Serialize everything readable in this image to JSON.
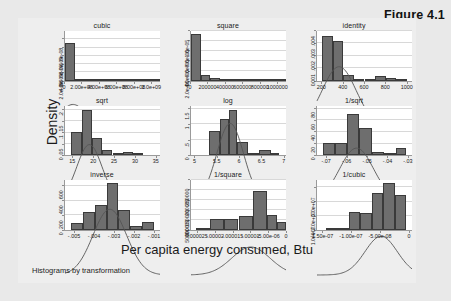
{
  "figure": {
    "caption": "Figure 4.1",
    "ylabel": "Density",
    "xlabel": "Per capita energy consumed, Btu",
    "note": "Histograms by transformation"
  },
  "style": {
    "bar_fill": "#6e6e6e",
    "bar_edge": "#3a3a3a",
    "plot_bg": "#ffffff",
    "page_bg": "#e9e9e9",
    "graph_bg": "#eeeeee",
    "grid": "#d8d8d8",
    "curve": "#555555"
  },
  "chart_data": {
    "type": "bar",
    "title": "Histograms by transformation",
    "xlabel": "Per capita energy consumed, Btu",
    "ylabel": "Density",
    "layout": {
      "rows": 3,
      "cols": 3,
      "grid": true,
      "legend": "none",
      "overlay": "normal density curve"
    },
    "panels": [
      {
        "title": "cubic",
        "row": 1,
        "col": 1,
        "xlim": [
          0,
          1100000000.0
        ],
        "ylim": [
          0,
          1.2e-08
        ],
        "xticks": [
          0,
          200000000.0,
          400000000.0,
          600000000.0,
          800000000.0,
          1000000000.0
        ],
        "xticklabels": [
          "0",
          "2.00e+08",
          "4.00e+08",
          "6.00e+08",
          "8.00e+08",
          "1.0e+09"
        ],
        "yticks": [
          0,
          2e-09,
          4e-09,
          6e-09,
          8e-09,
          1e-08
        ],
        "yticklabels": [
          "0",
          "2.0e-09",
          "4.0e-09",
          "6.0e-09",
          "8.0e-09",
          "1.0e-08"
        ],
        "bin_edges": [
          0,
          110000000.0,
          220000000.0,
          330000000.0,
          440000000.0,
          550000000.0,
          660000000.0,
          770000000.0,
          880000000.0,
          990000000.0,
          1100000000.0
        ],
        "values": [
          9.1e-09,
          4e-10,
          1e-10,
          2.5e-10,
          1e-10,
          0,
          0,
          0,
          1e-10,
          1e-10
        ]
      },
      {
        "title": "square",
        "row": 1,
        "col": 2,
        "xlim": [
          0,
          1100000
        ],
        "ylim": [
          0,
          1e-05
        ],
        "xticks": [
          0,
          200000,
          400000,
          600000,
          800000,
          1000000
        ],
        "xticklabels": [
          "0",
          "200000",
          "400000",
          "600000",
          "800000",
          "1000000"
        ],
        "yticks": [
          0,
          2e-06,
          4e-06,
          6e-06,
          8e-06,
          1e-05
        ],
        "yticklabels": [
          "0",
          "2.0e-06",
          "4.0e-06",
          "6.0e-06",
          "8.0e-06",
          "1.0e-05"
        ],
        "bin_edges": [
          0,
          110000,
          220000,
          330000,
          440000,
          550000,
          660000,
          770000,
          880000,
          990000,
          1100000
        ],
        "values": [
          9.3e-06,
          1.1e-06,
          5e-07,
          1e-07,
          1e-07,
          4e-07,
          3e-07,
          1e-07,
          1e-07,
          1e-07
        ]
      },
      {
        "title": "identity",
        "row": 1,
        "col": 3,
        "xlim": [
          150,
          1050
        ],
        "ylim": [
          0,
          0.004
        ],
        "xticks": [
          200,
          400,
          600,
          800,
          1000
        ],
        "xticklabels": [
          "200",
          "400",
          "600",
          "800",
          "1000"
        ],
        "yticks": [
          0,
          0.001,
          0.002,
          0.003,
          0.004
        ],
        "yticklabels": [
          "0",
          ".001",
          ".002",
          ".003",
          ".004"
        ],
        "bin_edges": [
          200,
          300,
          400,
          500,
          600,
          700,
          800,
          900,
          1000
        ],
        "values": [
          0.0036,
          0.0032,
          0.00045,
          0.00015,
          0.0001,
          0.0004,
          0.00025,
          8e-05
        ]
      },
      {
        "title": "sqrt",
        "row": 2,
        "col": 1,
        "xlim": [
          13,
          36
        ],
        "ylim": [
          0,
          0.22
        ],
        "xticks": [
          15,
          20,
          25,
          30,
          35
        ],
        "xticklabels": [
          "15",
          "20",
          "25",
          "30",
          "35"
        ],
        "yticks": [
          0,
          0.05,
          0.1,
          0.15,
          0.2
        ],
        "yticklabels": [
          "0",
          ".05",
          ".1",
          ".15",
          ".2"
        ],
        "bin_edges": [
          14.5,
          17,
          19.5,
          22,
          24.5,
          27,
          29.5,
          32
        ],
        "values": [
          0.102,
          0.2,
          0.075,
          0.022,
          0.004,
          0.013,
          0.006
        ]
      },
      {
        "title": "log",
        "row": 2,
        "col": 2,
        "xlim": [
          4.9,
          7.05
        ],
        "ylim": [
          0,
          1.6
        ],
        "xticks": [
          5,
          5.5,
          6,
          6.5,
          7
        ],
        "xticklabels": [
          "5",
          "5.5",
          "6",
          "6.5",
          "7"
        ],
        "yticks": [
          0,
          0.5,
          1,
          1.5
        ],
        "yticklabels": [
          "0",
          ".5",
          "1",
          "1.5"
        ],
        "bin_edges": [
          5.3,
          5.55,
          5.75,
          5.95,
          6.2,
          6.45,
          6.7,
          6.9
        ],
        "values": [
          0.78,
          1.18,
          1.45,
          0.42,
          0.06,
          0.16,
          0.07
        ]
      },
      {
        "title": "1/sqrt",
        "row": 2,
        "col": 3,
        "xlim": [
          -0.075,
          -0.028
        ],
        "ylim": [
          0,
          85
        ],
        "xticks": [
          -0.07,
          -0.06,
          -0.05,
          -0.04,
          -0.03
        ],
        "xticklabels": [
          "-.07",
          "-.06",
          "-.05",
          "-.04",
          "-.03"
        ],
        "yticks": [
          0,
          20,
          40,
          60,
          80
        ],
        "yticklabels": [
          "0",
          "20",
          "40",
          "60",
          "80"
        ],
        "bin_edges": [
          -0.072,
          -0.066,
          -0.06,
          -0.054,
          -0.048,
          -0.042,
          -0.036,
          -0.031
        ],
        "values": [
          21,
          21,
          70,
          47,
          6,
          4,
          12
        ]
      },
      {
        "title": "inverse",
        "row": 3,
        "col": 1,
        "xlim": [
          -0.0055,
          -0.0007
        ],
        "ylim": [
          0,
          680
        ],
        "xticks": [
          -0.005,
          -0.004,
          -0.003,
          -0.002,
          -0.001
        ],
        "xticklabels": [
          "-.005",
          "-.004",
          "-.003",
          "-.002",
          "-.001"
        ],
        "yticks": [
          0,
          200,
          400,
          600
        ],
        "yticklabels": [
          "0",
          "200",
          "400",
          "600"
        ],
        "bin_edges": [
          -0.0052,
          -0.0046,
          -0.004,
          -0.0034,
          -0.0028,
          -0.0022,
          -0.0016,
          -0.001
        ],
        "values": [
          95,
          245,
          345,
          650,
          280,
          60,
          105
        ]
      },
      {
        "title": "1/square",
        "row": 3,
        "col": 2,
        "xlim": [
          -2.7e-05,
          0
        ],
        "ylim": [
          0,
          250000
        ],
        "xticks": [
          -2.5e-05,
          -2e-05,
          -1.5e-05,
          -1e-05,
          -5e-06,
          0
        ],
        "xticklabels": [
          "-.000025",
          "-.00002",
          "-.000015",
          "-.00001",
          "-5.00e-06",
          "0"
        ],
        "yticks": [
          0,
          50000,
          100000,
          150000,
          200000,
          250000
        ],
        "yticklabels": [
          "0",
          "50000",
          "100000",
          "150000",
          "200000",
          "250000"
        ],
        "bin_edges": [
          -2.55e-05,
          -2.15e-05,
          -1.75e-05,
          -1.35e-05,
          -9.5e-06,
          -5.5e-06,
          -2.5e-06,
          0
        ],
        "values": [
          9000,
          55000,
          55000,
          68000,
          195000,
          78000,
          40000
        ]
      },
      {
        "title": "1/cubic",
        "row": 3,
        "col": 3,
        "xlim": [
          -1.6e-07,
          5e-09
        ],
        "ylim": [
          0,
          35000000.0
        ],
        "xticks": [
          -1.5e-07,
          -1e-07,
          -5e-08,
          0
        ],
        "xticklabels": [
          "-1.50e-07",
          "-1.00e-07",
          "-5.00e-08",
          "0"
        ],
        "yticks": [
          0,
          10000000.0,
          20000000.0,
          30000000.0
        ],
        "yticklabels": [
          "0",
          "1.0e+07",
          "2.0e+07",
          "3.0e+07"
        ],
        "bin_edges": [
          -1.45e-07,
          -1.25e-07,
          -1.05e-07,
          -8.5e-08,
          -6.5e-08,
          -4.5e-08,
          -2.5e-08,
          -5e-09
        ],
        "values": [
          1200000.0,
          1500000.0,
          13000000.0,
          12000000.0,
          26000000.0,
          33000000.0,
          25000000.0
        ]
      }
    ]
  }
}
